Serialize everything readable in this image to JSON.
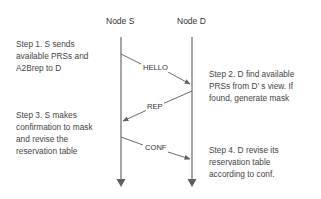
{
  "nodes": [
    {
      "id": "S",
      "label": "Node S"
    },
    {
      "id": "D",
      "label": "Node D"
    }
  ],
  "messages": [
    {
      "label": "HELLO",
      "from": "S",
      "to": "D"
    },
    {
      "label": "REP",
      "from": "D",
      "to": "S"
    },
    {
      "label": "CONF",
      "from": "S",
      "to": "D"
    }
  ],
  "steps": [
    {
      "text": "Step 1. S sends\navailable PRSs and\nA2Brep to D"
    },
    {
      "text": "Step 2. D find available\nPRSs from D’ s view. If\nfound, generate mask"
    },
    {
      "text": "Step 3. S makes\nconfirmation to mask\nand revise the\nreservation table"
    },
    {
      "text": "Step 4. D revise its\nreservation table\naccording to conf."
    }
  ],
  "colors": {
    "line": "#6b6b6b",
    "text": "#444444"
  }
}
